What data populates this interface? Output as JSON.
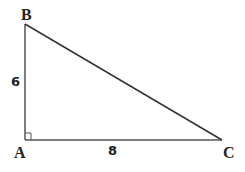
{
  "diagram": {
    "type": "right-triangle",
    "vertices": {
      "A": {
        "label": "A",
        "x": 25,
        "y": 140
      },
      "B": {
        "label": "B",
        "x": 25,
        "y": 24
      },
      "C": {
        "label": "C",
        "x": 222,
        "y": 140
      }
    },
    "sides": {
      "AB": {
        "label": "6"
      },
      "AC": {
        "label": "8"
      }
    },
    "right_angle_at": "A",
    "line_color": "#555555"
  }
}
